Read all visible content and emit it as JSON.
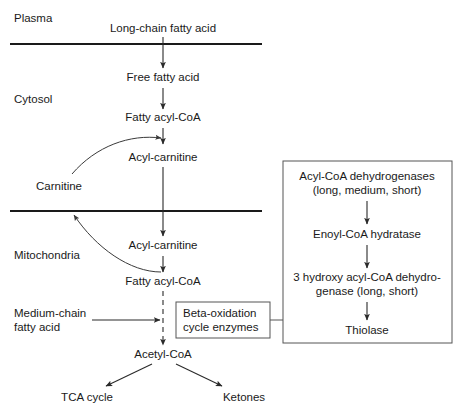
{
  "diagram": {
    "colors": {
      "background": "#ffffff",
      "ink": "#1a1a1a",
      "line": "#2a2a2a",
      "box_border": "#555555"
    },
    "compartments": [
      {
        "id": "plasma",
        "label": "Plasma"
      },
      {
        "id": "cytosol",
        "label": "Cytosol"
      },
      {
        "id": "mitochondria",
        "label": "Mitochondria"
      }
    ],
    "metabolites": {
      "long_chain_fatty_acid": "Long-chain fatty acid",
      "free_fatty_acid": "Free fatty acid",
      "fatty_acyl_coa_cytosol": "Fatty acyl-CoA",
      "acyl_carnitine_outer": "Acyl-carnitine",
      "carnitine": "Carnitine",
      "acyl_carnitine_inner": "Acyl-carnitine",
      "fatty_acyl_coa_mito": "Fatty acyl-CoA",
      "medium_chain_fatty_acid_line1": "Medium-chain",
      "medium_chain_fatty_acid_line2": "fatty acid",
      "acetyl_coa": "Acetyl-CoA",
      "tca_cycle": "TCA cycle",
      "ketones": "Ketones"
    },
    "beta_oxidation_box": {
      "line1": "Beta-oxidation",
      "line2": "cycle enzymes"
    },
    "enzyme_box": {
      "steps": [
        {
          "line1": "Acyl-CoA dehydrogenases",
          "line2": "(long, medium, short)"
        },
        {
          "line1": "Enoyl-CoA hydratase",
          "line2": ""
        },
        {
          "line1": "3 hydroxy acyl-CoA dehydro-",
          "line2": "genase (long, short)"
        },
        {
          "line1": "Thiolase",
          "line2": ""
        }
      ]
    }
  }
}
